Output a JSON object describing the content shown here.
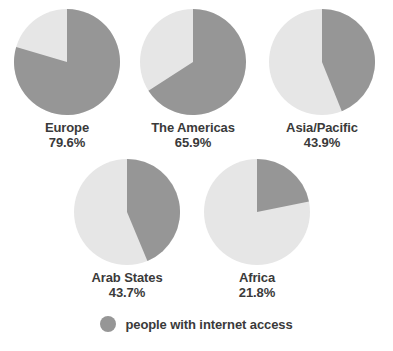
{
  "chart_data": {
    "type": "pie",
    "title": "",
    "subtitle": "",
    "xlabel": "",
    "ylabel": "",
    "grid": false,
    "legend_position": "bottom",
    "legend": [
      {
        "label": "people with internet access",
        "color": "#969696"
      }
    ],
    "colors": {
      "with_access": "#969696",
      "without_access": "#e6e6e6",
      "text": "#3a3a3a",
      "background": "#ffffff"
    },
    "series": [
      {
        "name": "people with internet access",
        "values": [
          79.6,
          65.9,
          43.9,
          43.7,
          21.8
        ]
      },
      {
        "name": "people without internet access",
        "values": [
          20.4,
          34.1,
          56.1,
          56.3,
          78.2
        ]
      }
    ],
    "categories": [
      "Europe",
      "The Americas",
      "Asia/Pacific",
      "Arab States",
      "Africa"
    ],
    "pies": [
      {
        "label": "Europe",
        "value": 79.6,
        "value_text": "79.6%",
        "remainder": 20.4
      },
      {
        "label": "The Americas",
        "value": 65.9,
        "value_text": "65.9%",
        "remainder": 34.1
      },
      {
        "label": "Asia/Pacific",
        "value": 43.9,
        "value_text": "43.9%",
        "remainder": 56.1
      },
      {
        "label": "Arab States",
        "value": 43.7,
        "value_text": "43.7%",
        "remainder": 56.3
      },
      {
        "label": "Africa",
        "value": 21.8,
        "value_text": "21.8%",
        "remainder": 78.2
      }
    ]
  },
  "layout": {
    "pie_diameter": 106,
    "positions": [
      {
        "cx": 67,
        "cy": 62
      },
      {
        "cx": 193,
        "cy": 62
      },
      {
        "cx": 322,
        "cy": 62
      },
      {
        "cx": 127,
        "cy": 212
      },
      {
        "cx": 257,
        "cy": 212
      }
    ]
  }
}
